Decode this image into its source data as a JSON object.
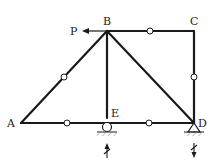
{
  "diagram": {
    "type": "truss",
    "nodes": [
      {
        "id": "A",
        "label": "A",
        "x": 21,
        "y": 123
      },
      {
        "id": "B",
        "label": "B",
        "x": 107,
        "y": 31
      },
      {
        "id": "C",
        "label": "C",
        "x": 194,
        "y": 31
      },
      {
        "id": "D",
        "label": "D",
        "x": 194,
        "y": 123
      },
      {
        "id": "E",
        "label": "E",
        "x": 107,
        "y": 123
      }
    ],
    "members": [
      {
        "from": "A",
        "to": "B",
        "zero_mark": true
      },
      {
        "from": "B",
        "to": "C",
        "zero_mark": true
      },
      {
        "from": "C",
        "to": "D",
        "zero_mark": true
      },
      {
        "from": "A",
        "to": "E",
        "zero_mark": true
      },
      {
        "from": "E",
        "to": "D",
        "zero_mark": true
      },
      {
        "from": "B",
        "to": "E",
        "zero_mark": false
      },
      {
        "from": "B",
        "to": "D",
        "zero_mark": false
      }
    ],
    "load": {
      "label": "P",
      "node": "B",
      "direction": "left"
    },
    "supports": [
      {
        "node": "E",
        "type": "roller"
      },
      {
        "node": "D",
        "type": "pin"
      }
    ],
    "reactions": [
      {
        "node": "E",
        "direction": "up",
        "crossed": true
      },
      {
        "node": "D",
        "direction": "down",
        "crossed": true
      }
    ],
    "colors": {
      "line": "#1a1a1a",
      "hatch": "#888888"
    }
  }
}
